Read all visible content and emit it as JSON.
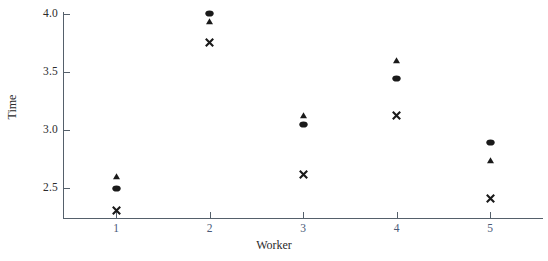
{
  "chart_data": {
    "type": "scatter",
    "title": "",
    "xlabel": "Worker",
    "ylabel": "Time",
    "x": [
      1,
      2,
      3,
      4,
      5
    ],
    "xticklabels": [
      "1",
      "2",
      "3",
      "4",
      "5"
    ],
    "yticklabels": [
      "4.0",
      "3.5",
      "3.0",
      "2.5"
    ],
    "ytickvalues": [
      4.0,
      3.5,
      3.0,
      2.5
    ],
    "xlim": [
      0.55,
      5.6
    ],
    "ylim": [
      2.27,
      4.05
    ],
    "grid": false,
    "legend": "none",
    "series": [
      {
        "name": "circle",
        "marker": "circle",
        "categories": [
          "1",
          "2",
          "3",
          "4",
          "5"
        ],
        "values": [
          2.5,
          4.0,
          3.05,
          3.44,
          2.89
        ]
      },
      {
        "name": "triangle",
        "marker": "triangle",
        "categories": [
          "1",
          "2",
          "3",
          "4",
          "5"
        ],
        "values": [
          2.6,
          3.93,
          3.12,
          3.6,
          2.74
        ]
      },
      {
        "name": "cross",
        "marker": "x",
        "categories": [
          "1",
          "2",
          "3",
          "4",
          "5"
        ],
        "values": [
          2.31,
          3.75,
          2.62,
          3.12,
          2.41
        ]
      }
    ],
    "colors": {
      "marker": "#1a1a1a",
      "axis": "#55606b",
      "ytick_label": "#2b2b2b",
      "xtick_label": "#4a5a78",
      "background": "#ffffff"
    }
  }
}
